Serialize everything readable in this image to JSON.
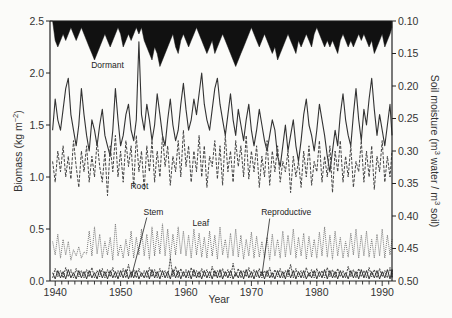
{
  "chart_data": {
    "type": "line",
    "title": "",
    "xlabel": "Year",
    "ylabel_left": "Biomass (kg m−2)",
    "ylabel_right": "Soil moisture (m3 water / m3 soil)",
    "xlim": [
      1939.2,
      1991.5
    ],
    "ylim_left": [
      0.0,
      2.5
    ],
    "ylim_right_inverted": [
      0.1,
      0.5
    ],
    "x_ticks": [
      1940,
      1950,
      1960,
      1970,
      1980,
      1990
    ],
    "y_ticks_left": [
      "0.0",
      "0.5",
      "1.0",
      "1.5",
      "2.0",
      "2.5"
    ],
    "y_ticks_right": [
      "0.10",
      "0.15",
      "0.20",
      "0.25",
      "0.30",
      "0.35",
      "0.40",
      "0.45",
      "0.50"
    ],
    "grid": false,
    "legend": "inline annotations",
    "annotations": [
      {
        "text": "Dormant",
        "x": 1945.5,
        "y": 2.05
      },
      {
        "text": "Root",
        "x": 1951.5,
        "y": 0.88
      },
      {
        "text": "Stem",
        "x": 1953.5,
        "y": 0.63
      },
      {
        "text": "Leaf",
        "x": 1961.0,
        "y": 0.53
      },
      {
        "text": "Reproductive",
        "x": 1971.5,
        "y": 0.63
      }
    ],
    "series": [
      {
        "name": "Soil moisture",
        "axis": "right",
        "style": "filled-black-from-top",
        "x_start": 1939.6,
        "x_step": 0.4,
        "values": [
          0.1,
          0.13,
          0.14,
          0.13,
          0.12,
          0.13,
          0.12,
          0.11,
          0.12,
          0.13,
          0.12,
          0.11,
          0.12,
          0.13,
          0.14,
          0.15,
          0.16,
          0.15,
          0.14,
          0.13,
          0.12,
          0.13,
          0.14,
          0.13,
          0.12,
          0.11,
          0.12,
          0.14,
          0.13,
          0.12,
          0.13,
          0.12,
          0.11,
          0.12,
          0.11,
          0.13,
          0.14,
          0.15,
          0.16,
          0.14,
          0.15,
          0.17,
          0.16,
          0.15,
          0.14,
          0.13,
          0.12,
          0.14,
          0.15,
          0.13,
          0.12,
          0.13,
          0.14,
          0.13,
          0.12,
          0.11,
          0.12,
          0.13,
          0.14,
          0.15,
          0.14,
          0.13,
          0.15,
          0.14,
          0.13,
          0.12,
          0.13,
          0.14,
          0.15,
          0.16,
          0.17,
          0.16,
          0.15,
          0.14,
          0.13,
          0.12,
          0.11,
          0.12,
          0.13,
          0.14,
          0.13,
          0.12,
          0.13,
          0.14,
          0.15,
          0.14,
          0.16,
          0.15,
          0.14,
          0.13,
          0.12,
          0.13,
          0.14,
          0.15,
          0.13,
          0.14,
          0.13,
          0.12,
          0.13,
          0.14,
          0.12,
          0.11,
          0.12,
          0.13,
          0.14,
          0.13,
          0.14,
          0.13,
          0.14,
          0.15,
          0.13,
          0.12,
          0.13,
          0.14,
          0.13,
          0.14,
          0.13,
          0.12,
          0.13,
          0.12,
          0.13,
          0.14,
          0.13,
          0.15,
          0.14,
          0.13,
          0.12,
          0.14,
          0.13,
          0.12,
          0.11
        ]
      },
      {
        "name": "Dormant",
        "axis": "left",
        "style": "solid",
        "x_start": 1939.6,
        "x_step": 0.4,
        "values": [
          1.45,
          1.75,
          1.55,
          1.45,
          1.65,
          1.85,
          1.95,
          1.6,
          1.45,
          1.3,
          1.5,
          1.85,
          1.6,
          1.4,
          1.25,
          1.55,
          1.45,
          1.3,
          1.5,
          1.65,
          1.4,
          1.3,
          1.2,
          1.45,
          1.85,
          1.55,
          1.3,
          1.4,
          1.6,
          1.7,
          1.45,
          1.35,
          1.55,
          2.3,
          1.6,
          1.45,
          1.7,
          1.55,
          1.35,
          1.5,
          1.8,
          1.6,
          1.4,
          1.3,
          1.55,
          1.75,
          1.5,
          1.35,
          1.45,
          1.7,
          1.9,
          1.65,
          1.45,
          1.55,
          1.75,
          1.6,
          1.8,
          2.0,
          1.7,
          1.55,
          1.45,
          1.65,
          1.85,
          1.95,
          1.7,
          1.55,
          1.4,
          1.6,
          1.8,
          1.55,
          1.4,
          1.65,
          1.5,
          1.35,
          1.55,
          1.7,
          1.45,
          1.3,
          1.45,
          1.65,
          1.5,
          1.35,
          1.25,
          1.4,
          1.55,
          1.45,
          1.2,
          1.1,
          1.3,
          1.5,
          1.25,
          1.4,
          1.55,
          1.3,
          1.15,
          1.35,
          1.6,
          1.75,
          1.5,
          1.4,
          1.25,
          1.45,
          1.7,
          1.55,
          1.4,
          1.2,
          1.05,
          1.25,
          1.45,
          1.3,
          1.6,
          1.8,
          1.55,
          1.4,
          1.3,
          1.6,
          1.85,
          1.55,
          1.35,
          1.65,
          1.5,
          1.75,
          1.95,
          1.65,
          1.4,
          1.6,
          1.45,
          1.3,
          1.5,
          1.7,
          1.4
        ]
      },
      {
        "name": "Root",
        "axis": "left",
        "style": "dashed",
        "x_start": 1939.6,
        "x_step": 0.4,
        "values": [
          1.15,
          0.95,
          1.25,
          1.05,
          1.3,
          1.0,
          1.2,
          0.98,
          1.35,
          1.1,
          0.9,
          1.25,
          1.05,
          1.3,
          0.95,
          1.2,
          1.0,
          1.35,
          1.1,
          0.95,
          1.25,
          0.82,
          1.3,
          1.05,
          1.4,
          1.0,
          1.25,
          0.95,
          1.35,
          1.1,
          1.3,
          0.9,
          1.4,
          1.05,
          1.25,
          0.88,
          1.3,
          1.05,
          1.35,
          0.95,
          1.25,
          1.0,
          1.4,
          1.1,
          1.3,
          0.92,
          1.2,
          1.05,
          1.35,
          1.0,
          1.45,
          1.1,
          1.3,
          0.95,
          1.25,
          1.05,
          1.4,
          1.0,
          1.3,
          0.9,
          1.2,
          1.1,
          1.35,
          0.98,
          1.3,
          0.92,
          1.4,
          1.05,
          1.25,
          0.95,
          1.35,
          1.1,
          1.3,
          1.0,
          1.4,
          0.98,
          1.25,
          1.05,
          1.3,
          0.9,
          1.2,
          1.0,
          1.35,
          0.92,
          1.25,
          1.05,
          1.3,
          0.95,
          1.15,
          1.05,
          1.25,
          0.85,
          1.2,
          1.0,
          1.15,
          0.9,
          1.25,
          1.0,
          1.3,
          0.92,
          1.15,
          1.05,
          1.35,
          0.95,
          1.2,
          1.0,
          1.3,
          0.85,
          1.25,
          1.05,
          1.35,
          0.95,
          1.2,
          1.0,
          1.3,
          0.9,
          1.15,
          1.05,
          1.35,
          0.95,
          1.25,
          1.0,
          1.3,
          0.88,
          1.2,
          1.05,
          1.35,
          0.95,
          1.2,
          1.0,
          1.25
        ]
      },
      {
        "name": "Leaf",
        "axis": "left",
        "style": "dotted",
        "x_start": 1939.6,
        "x_step": 0.4,
        "values": [
          0.38,
          0.25,
          0.45,
          0.22,
          0.4,
          0.25,
          0.38,
          0.2,
          0.3,
          0.24,
          0.33,
          0.22,
          0.28,
          0.26,
          0.48,
          0.24,
          0.52,
          0.26,
          0.45,
          0.22,
          0.38,
          0.25,
          0.42,
          0.2,
          0.55,
          0.24,
          0.35,
          0.22,
          0.4,
          0.24,
          0.48,
          0.22,
          0.42,
          0.25,
          0.5,
          0.24,
          0.45,
          0.21,
          0.52,
          0.24,
          0.48,
          0.26,
          0.55,
          0.24,
          0.5,
          0.22,
          0.45,
          0.25,
          0.52,
          0.26,
          0.48,
          0.24,
          0.44,
          0.22,
          0.5,
          0.25,
          0.46,
          0.23,
          0.42,
          0.22,
          0.48,
          0.24,
          0.44,
          0.21,
          0.52,
          0.25,
          0.4,
          0.22,
          0.46,
          0.24,
          0.5,
          0.23,
          0.44,
          0.21,
          0.4,
          0.24,
          0.47,
          0.22,
          0.43,
          0.23,
          0.38,
          0.22,
          0.42,
          0.2,
          0.45,
          0.24,
          0.4,
          0.22,
          0.48,
          0.23,
          0.44,
          0.25,
          0.5,
          0.22,
          0.42,
          0.24,
          0.46,
          0.21,
          0.43,
          0.23,
          0.4,
          0.22,
          0.47,
          0.24,
          0.52,
          0.23,
          0.44,
          0.21,
          0.48,
          0.24,
          0.42,
          0.22,
          0.38,
          0.23,
          0.46,
          0.25,
          0.5,
          0.22,
          0.44,
          0.24,
          0.48,
          0.23,
          0.4,
          0.22,
          0.45,
          0.24,
          0.5,
          0.22,
          0.44,
          0.25,
          0.4
        ]
      },
      {
        "name": "Stem",
        "axis": "left",
        "style": "solid",
        "x_start": 1939.6,
        "x_step": 0.4,
        "values": [
          0.08,
          0.02,
          0.1,
          0.03,
          0.09,
          0.02,
          0.11,
          0.03,
          0.08,
          0.02,
          0.1,
          0.03,
          0.09,
          0.02,
          0.1,
          0.03,
          0.08,
          0.02,
          0.11,
          0.03,
          0.09,
          0.02,
          0.1,
          0.03,
          0.09,
          0.02,
          0.1,
          0.03,
          0.11,
          0.02,
          0.09,
          0.03,
          0.1,
          0.02,
          0.08,
          0.03,
          0.1,
          0.02,
          0.11,
          0.03,
          0.09,
          0.02,
          0.1,
          0.03,
          0.09,
          0.02,
          0.11,
          0.03,
          0.1,
          0.02,
          0.09,
          0.03,
          0.1,
          0.02,
          0.11,
          0.03,
          0.09,
          0.02,
          0.1,
          0.03,
          0.09,
          0.02,
          0.1,
          0.03,
          0.11,
          0.02,
          0.09,
          0.03,
          0.1,
          0.02,
          0.08,
          0.03,
          0.1,
          0.02,
          0.11,
          0.03,
          0.09,
          0.02,
          0.1,
          0.03,
          0.09,
          0.02,
          0.1,
          0.03,
          0.08,
          0.02,
          0.1,
          0.03,
          0.09,
          0.02,
          0.11,
          0.03,
          0.1,
          0.02,
          0.09,
          0.03,
          0.1,
          0.02,
          0.08,
          0.03,
          0.1,
          0.02,
          0.09,
          0.03,
          0.11,
          0.02,
          0.1,
          0.03,
          0.09,
          0.02,
          0.1,
          0.03,
          0.08,
          0.02,
          0.1,
          0.03,
          0.09,
          0.02,
          0.11,
          0.03,
          0.1,
          0.02,
          0.09,
          0.03,
          0.1,
          0.02,
          0.09,
          0.03,
          0.11,
          0.02,
          0.1
        ]
      },
      {
        "name": "Reproductive",
        "axis": "left",
        "style": "dash-dot",
        "x_start": 1939.6,
        "x_step": 0.4,
        "values": [
          0.03,
          0.12,
          0.04,
          0.1,
          0.03,
          0.13,
          0.04,
          0.11,
          0.03,
          0.12,
          0.04,
          0.1,
          0.03,
          0.11,
          0.04,
          0.13,
          0.03,
          0.1,
          0.04,
          0.12,
          0.03,
          0.11,
          0.04,
          0.13,
          0.03,
          0.1,
          0.04,
          0.12,
          0.03,
          0.16,
          0.04,
          0.11,
          0.03,
          0.12,
          0.04,
          0.1,
          0.03,
          0.13,
          0.04,
          0.11,
          0.03,
          0.12,
          0.04,
          0.1,
          0.03,
          0.22,
          0.04,
          0.14,
          0.03,
          0.12,
          0.04,
          0.11,
          0.03,
          0.13,
          0.04,
          0.1,
          0.03,
          0.12,
          0.04,
          0.11,
          0.03,
          0.14,
          0.04,
          0.1,
          0.03,
          0.12,
          0.04,
          0.11,
          0.03,
          0.17,
          0.04,
          0.12,
          0.03,
          0.1,
          0.04,
          0.13,
          0.03,
          0.11,
          0.04,
          0.12,
          0.03,
          0.1,
          0.04,
          0.13,
          0.03,
          0.11,
          0.04,
          0.12,
          0.03,
          0.1,
          0.04,
          0.16,
          0.03,
          0.12,
          0.04,
          0.1,
          0.03,
          0.13,
          0.04,
          0.11,
          0.03,
          0.12,
          0.04,
          0.1,
          0.03,
          0.13,
          0.04,
          0.11,
          0.03,
          0.12,
          0.04,
          0.1,
          0.03,
          0.14,
          0.04,
          0.11,
          0.03,
          0.12,
          0.04,
          0.1,
          0.03,
          0.13,
          0.04,
          0.11,
          0.03,
          0.12,
          0.04,
          0.1,
          0.03,
          0.13,
          0.04,
          0.11,
          0.03,
          0.12
        ]
      }
    ],
    "leader_lines": [
      {
        "label": "Stem",
        "from": [
          1954.0,
          0.61
        ],
        "to": [
          1951.6,
          0.03
        ]
      },
      {
        "label": "Reproductive",
        "from": [
          1972.8,
          0.6
        ],
        "to": [
          1971.6,
          0.05
        ]
      }
    ]
  }
}
